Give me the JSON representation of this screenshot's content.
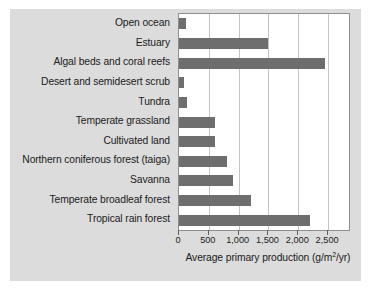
{
  "chart_data": {
    "type": "bar",
    "orientation": "horizontal",
    "title": "",
    "xlabel": "Average primary production (g/m2/yr)",
    "ylabel": "",
    "xlim": [
      0,
      2850
    ],
    "grid": true,
    "legend": "none",
    "categories": [
      "Open ocean",
      "Estuary",
      "Algal beds and coral reefs",
      "Desert and semidesert scrub",
      "Tundra",
      "Temperate grassland",
      "Cultivated land",
      "Northern coniferous forest (taiga)",
      "Savanna",
      "Temperate broadleaf forest",
      "Tropical rain forest"
    ],
    "values": [
      125,
      1500,
      2450,
      90,
      140,
      600,
      600,
      800,
      900,
      1200,
      2200
    ],
    "tick_values": [
      0,
      500,
      1000,
      1500,
      2000,
      2500
    ],
    "tick_labels": [
      "0",
      "500",
      "1,000",
      "1,500",
      "2,000",
      "2,500"
    ]
  },
  "axis_title": {
    "prefix": "Average primary production (g/m",
    "exponent": "2",
    "suffix": "/yr)"
  },
  "colors": {
    "bar": "#6e6e6e",
    "panel_background": "#dcdcdc",
    "plot_background": "#ffffff",
    "gridline": "#c3c3c3",
    "frame": "#8e8e8e",
    "text": "#1b1b1b"
  }
}
